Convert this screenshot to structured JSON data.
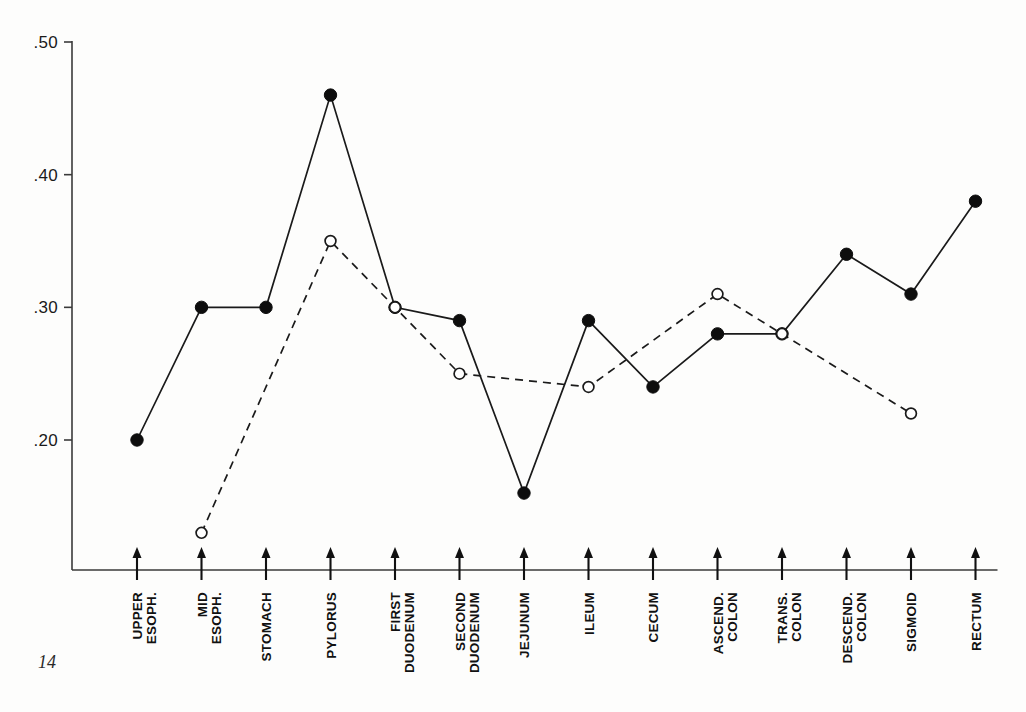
{
  "page": {
    "number": "14"
  },
  "chart_data": {
    "type": "line",
    "title": "",
    "subtitle": "",
    "xlabel": "",
    "ylabel": "",
    "ylim": [
      0.09,
      0.5
    ],
    "yticks": [
      0.5,
      0.4,
      0.3,
      0.2
    ],
    "ytick_labels": [
      ".50",
      ".40",
      ".30",
      ".20"
    ],
    "grid": false,
    "legend": "none",
    "categories": [
      "UPPER ESOPH.",
      "MID ESOPH.",
      "STOMACH",
      "PYLORUS",
      "FIRST DUODENUM",
      "SECOND DUODENUM",
      "JEJUNUM",
      "ILEUM",
      "CECUM",
      "ASCEND. COLON",
      "TRANS. COLON",
      "DESCEND. COLON",
      "SIGMOID",
      "RECTUM"
    ],
    "category_lines": [
      [
        "UPPER",
        "ESOPH."
      ],
      [
        "MID",
        "ESOPH."
      ],
      [
        "STOMACH"
      ],
      [
        "PYLORUS"
      ],
      [
        "FIRST",
        "DUODENUM"
      ],
      [
        "SECOND",
        "DUODENUM"
      ],
      [
        "JEJUNUM"
      ],
      [
        "ILEUM"
      ],
      [
        "CECUM"
      ],
      [
        "ASCEND.",
        "COLON"
      ],
      [
        "TRANS.",
        "COLON"
      ],
      [
        "DESCEND.",
        "COLON"
      ],
      [
        "SIGMOID"
      ],
      [
        "RECTUM"
      ]
    ],
    "series": [
      {
        "name": "solid-filled-circles",
        "style": "solid",
        "marker": "filled-circle",
        "values": [
          0.2,
          0.3,
          0.3,
          0.46,
          0.3,
          0.29,
          0.16,
          0.29,
          0.24,
          0.28,
          0.28,
          0.34,
          0.31,
          0.38
        ]
      },
      {
        "name": "dashed-open-circles",
        "style": "dashed",
        "marker": "open-circle",
        "values": [
          null,
          0.13,
          null,
          0.35,
          0.3,
          0.25,
          null,
          0.24,
          null,
          0.31,
          0.28,
          null,
          0.22,
          null
        ]
      }
    ]
  },
  "colors": {
    "ink": "#1a1a1a",
    "background": "#fdfdfc"
  }
}
